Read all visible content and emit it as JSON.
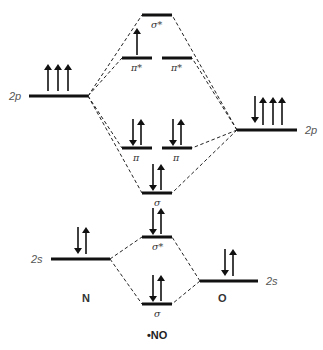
{
  "atoms": {
    "left": {
      "symbol": "N",
      "orbitals": {
        "2s": {
          "label": "2s",
          "electrons": "up-down"
        },
        "2p": {
          "label": "2p",
          "electrons": "up,up,up"
        }
      }
    },
    "right": {
      "symbol": "O",
      "orbitals": {
        "2s": {
          "label": "2s",
          "electrons": "up-down"
        },
        "2p": {
          "label": "2p",
          "electrons": "down-up,up,up"
        }
      }
    }
  },
  "molecular_orbitals": [
    {
      "id": "sigma_2s",
      "label": "σ",
      "electrons": 2
    },
    {
      "id": "sigma_star_2s",
      "label": "σ*",
      "electrons": 2
    },
    {
      "id": "sigma_2p",
      "label": "σ",
      "electrons": 2
    },
    {
      "id": "pi_2p_a",
      "label": "π",
      "electrons": 2
    },
    {
      "id": "pi_2p_b",
      "label": "π",
      "electrons": 2
    },
    {
      "id": "pi_star_2p_a",
      "label": "π*",
      "electrons": 1
    },
    {
      "id": "pi_star_2p_b",
      "label": "π*",
      "electrons": 0
    },
    {
      "id": "sigma_star_2p",
      "label": "σ*",
      "electrons": 0
    }
  ],
  "labels": {
    "n_2p": "2p",
    "o_2p": "2p",
    "n_2s": "2s",
    "o_2s": "2s",
    "n_atom": "N",
    "o_atom": "O",
    "molecule": "•NO",
    "sigma_star_top": "σ*",
    "pi_star_left": "π*",
    "pi_star_right": "π*",
    "pi_left": "π",
    "pi_right": "π",
    "sigma_2p": "σ",
    "sigma_star_2s": "σ*",
    "sigma_2s": "σ"
  }
}
